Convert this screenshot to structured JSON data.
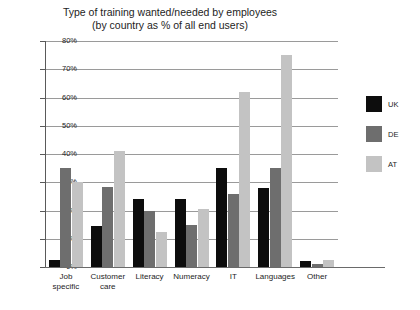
{
  "chart_data": {
    "type": "bar",
    "title": "Type of training wanted/needed by employees",
    "subtitle": "(by country as % of all end users)",
    "xlabel": "",
    "ylabel": "",
    "ylim": [
      0,
      80
    ],
    "grid": true,
    "legend_position": "right",
    "categories": [
      "Job specific",
      "Customer care",
      "Literacy",
      "Numeracy",
      "IT",
      "Languages",
      "Other"
    ],
    "category_lines": [
      [
        "Job",
        "specific"
      ],
      [
        "Customer",
        "care"
      ],
      [
        "Literacy"
      ],
      [
        "Numeracy"
      ],
      [
        "IT"
      ],
      [
        "Languages"
      ],
      [
        "Other"
      ]
    ],
    "ticks": [
      "0%",
      "10%",
      "20%",
      "30%",
      "40%",
      "50%",
      "60%",
      "70%",
      "80%"
    ],
    "tick_values": [
      0,
      10,
      20,
      30,
      40,
      50,
      60,
      70,
      80
    ],
    "series": [
      {
        "name": "UK",
        "color": "#0d0d0d",
        "values": [
          2.5,
          14.5,
          24,
          24,
          35,
          28,
          2
        ]
      },
      {
        "name": "DE",
        "color": "#6e6e6e",
        "values": [
          35,
          28.5,
          20,
          15,
          26,
          35,
          1
        ]
      },
      {
        "name": "AT",
        "color": "#c3c3c3",
        "values": [
          30,
          41,
          12.5,
          20.5,
          62,
          75,
          2.5
        ]
      }
    ]
  },
  "legend": {
    "items": [
      {
        "label": "UK",
        "color": "#0d0d0d"
      },
      {
        "label": "DE",
        "color": "#6e6e6e"
      },
      {
        "label": "AT",
        "color": "#c3c3c3"
      }
    ]
  }
}
